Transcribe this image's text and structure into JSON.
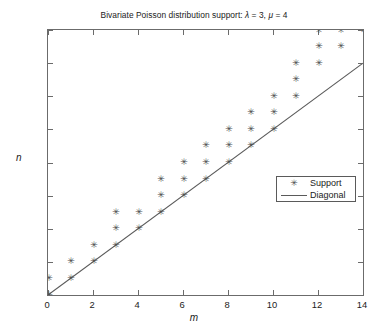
{
  "chart_data": {
    "type": "scatter",
    "title": "Bivariate Poisson distribution support: λ = 3, μ = 4",
    "title_parts": {
      "prefix": "Bivariate Poisson distribution support: ",
      "lambda_symbol": "λ",
      "lambda_value": " = 3, ",
      "mu_symbol": "μ",
      "mu_value": " = 4"
    },
    "xlabel": "m",
    "ylabel": "n",
    "xlim": [
      0,
      14
    ],
    "ylim": [
      0,
      16
    ],
    "xticks": [
      0,
      2,
      4,
      6,
      8,
      10,
      12,
      14
    ],
    "yticks": [
      0,
      2,
      4,
      6,
      8,
      10,
      12,
      14,
      16
    ],
    "grid": false,
    "legend_position": "center-right",
    "series": [
      {
        "name": "Support",
        "marker": "asterisk",
        "color": "#4d4d4d",
        "points": [
          [
            0,
            0
          ],
          [
            0,
            1
          ],
          [
            1,
            1
          ],
          [
            1,
            2
          ],
          [
            2,
            2
          ],
          [
            2,
            3
          ],
          [
            3,
            3
          ],
          [
            3,
            4
          ],
          [
            3,
            5
          ],
          [
            4,
            4
          ],
          [
            4,
            5
          ],
          [
            5,
            5
          ],
          [
            5,
            6
          ],
          [
            5,
            7
          ],
          [
            6,
            6
          ],
          [
            6,
            7
          ],
          [
            6,
            8
          ],
          [
            7,
            7
          ],
          [
            7,
            8
          ],
          [
            7,
            9
          ],
          [
            8,
            8
          ],
          [
            8,
            9
          ],
          [
            8,
            10
          ],
          [
            9,
            9
          ],
          [
            9,
            10
          ],
          [
            9,
            11
          ],
          [
            10,
            10
          ],
          [
            10,
            11
          ],
          [
            10,
            12
          ],
          [
            11,
            12
          ],
          [
            11,
            13
          ],
          [
            11,
            14
          ],
          [
            12,
            14
          ],
          [
            12,
            15
          ],
          [
            12,
            16
          ],
          [
            13,
            15
          ],
          [
            13,
            16
          ],
          [
            14,
            16
          ]
        ]
      },
      {
        "name": "Diagonal",
        "marker": "line",
        "color": "#5a5a5a",
        "line_from": [
          0,
          0
        ],
        "line_to": [
          14,
          14
        ]
      }
    ],
    "legend": [
      {
        "label": "Support",
        "symbol": "✳",
        "type": "marker"
      },
      {
        "label": "Diagonal",
        "symbol": "—",
        "type": "line"
      }
    ]
  }
}
